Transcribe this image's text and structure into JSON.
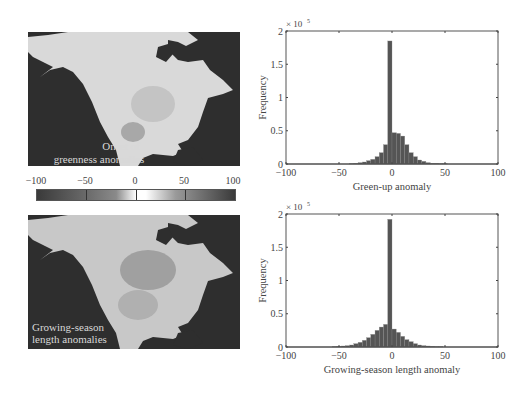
{
  "maps": [
    {
      "label_line1": "Onset of",
      "label_line2": "greenness anomalies"
    },
    {
      "label_line1": "Growing-season",
      "label_line2": "length anomalies"
    }
  ],
  "colorbar": {
    "ticks": [
      "−100",
      "−50",
      "0",
      "50",
      "100"
    ],
    "range": [
      -100,
      100
    ]
  },
  "chart_data": [
    {
      "type": "bar",
      "title": "",
      "xlabel": "Green-up anomaly",
      "ylabel": "Frequency",
      "y_multiplier": "× 10^5",
      "xlim": [
        -100,
        100
      ],
      "ylim": [
        0,
        2
      ],
      "xticks": [
        "−100",
        "−50",
        "0",
        "50",
        "100"
      ],
      "yticks": [
        "0",
        "0.5",
        "1",
        "1.5",
        "2"
      ],
      "bin_width": 4,
      "bin_centers": [
        -98,
        -94,
        -90,
        -86,
        -82,
        -78,
        -74,
        -70,
        -66,
        -62,
        -58,
        -54,
        -50,
        -46,
        -42,
        -38,
        -34,
        -30,
        -26,
        -22,
        -18,
        -14,
        -10,
        -6,
        -2,
        2,
        6,
        10,
        14,
        18,
        22,
        26,
        30,
        34,
        38,
        42,
        46,
        50,
        54,
        58,
        62,
        66,
        70,
        74,
        78,
        82,
        86,
        90,
        94,
        98
      ],
      "values": [
        0,
        0,
        0,
        0,
        0,
        0,
        0,
        0,
        0,
        0,
        0,
        0,
        0,
        0,
        0,
        0.005,
        0.01,
        0.02,
        0.03,
        0.05,
        0.07,
        0.11,
        0.17,
        0.29,
        1.85,
        0.47,
        0.46,
        0.42,
        0.29,
        0.17,
        0.11,
        0.06,
        0.04,
        0.02,
        0.01,
        0.01,
        0.005,
        0.005,
        0,
        0,
        0,
        0,
        0,
        0,
        0,
        0,
        0,
        0,
        0,
        0
      ],
      "grid": false
    },
    {
      "type": "bar",
      "title": "",
      "xlabel": "Growing-season length anomaly",
      "ylabel": "Frequency",
      "y_multiplier": "× 10^5",
      "xlim": [
        -100,
        100
      ],
      "ylim": [
        0,
        2
      ],
      "xticks": [
        "−100",
        "−50",
        "0",
        "50",
        "100"
      ],
      "yticks": [
        "0",
        "0.5",
        "1",
        "1.5",
        "2"
      ],
      "bin_width": 4,
      "bin_centers": [
        -98,
        -94,
        -90,
        -86,
        -82,
        -78,
        -74,
        -70,
        -66,
        -62,
        -58,
        -54,
        -50,
        -46,
        -42,
        -38,
        -34,
        -30,
        -26,
        -22,
        -18,
        -14,
        -10,
        -6,
        -2,
        2,
        6,
        10,
        14,
        18,
        22,
        26,
        30,
        34,
        38,
        42,
        46,
        50,
        54,
        58,
        62,
        66,
        70,
        74,
        78,
        82,
        86,
        90,
        94,
        98
      ],
      "values": [
        0,
        0,
        0,
        0,
        0,
        0,
        0,
        0,
        0,
        0,
        0,
        0.005,
        0.01,
        0.015,
        0.02,
        0.03,
        0.05,
        0.07,
        0.1,
        0.14,
        0.19,
        0.25,
        0.3,
        0.34,
        1.92,
        0.27,
        0.22,
        0.16,
        0.11,
        0.08,
        0.05,
        0.03,
        0.02,
        0.015,
        0.01,
        0.005,
        0.005,
        0,
        0,
        0,
        0,
        0,
        0,
        0,
        0,
        0,
        0,
        0,
        0,
        0
      ],
      "grid": false
    }
  ]
}
